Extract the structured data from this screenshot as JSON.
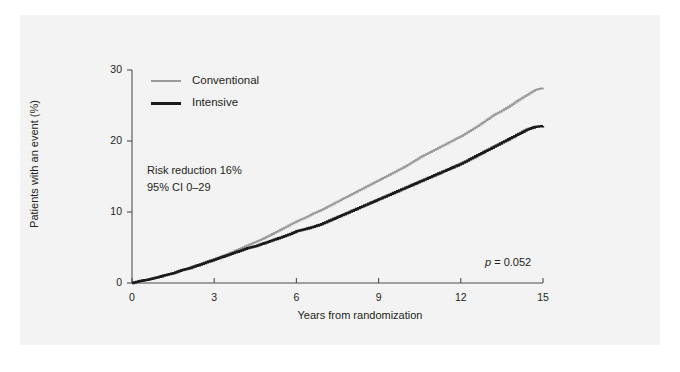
{
  "chart_data": {
    "type": "line",
    "title": "",
    "subtitle": "",
    "xlabel": "Years from randomization",
    "ylabel": "Patients with an event (%)",
    "xlim": [
      0,
      15
    ],
    "ylim": [
      0,
      30
    ],
    "xticks": [
      "0",
      "3",
      "6",
      "9",
      "12",
      "15"
    ],
    "xtick_values": [
      0,
      3,
      6,
      9,
      12,
      15
    ],
    "yticks": [
      "0",
      "10",
      "20",
      "30"
    ],
    "ytick_values": [
      0,
      10,
      20,
      30
    ],
    "grid": false,
    "legend_position": "top-left-inside",
    "step_style": "step-post",
    "series": [
      {
        "name": "Conventional",
        "color": "#9a9a9a",
        "x": [
          0,
          0.3,
          0.6,
          0.9,
          1.2,
          1.5,
          1.8,
          2.1,
          2.4,
          2.7,
          3.0,
          3.3,
          3.6,
          3.9,
          4.2,
          4.5,
          4.8,
          5.1,
          5.4,
          5.7,
          6.0,
          6.3,
          6.6,
          6.9,
          7.2,
          7.5,
          7.8,
          8.1,
          8.4,
          8.7,
          9.0,
          9.3,
          9.6,
          9.9,
          10.2,
          10.5,
          10.8,
          11.1,
          11.4,
          11.7,
          12.0,
          12.3,
          12.6,
          12.9,
          13.2,
          13.5,
          13.8,
          14.1,
          14.4,
          14.7,
          15.0
        ],
        "y": [
          0.0,
          0.3,
          0.5,
          0.8,
          1.1,
          1.4,
          1.8,
          2.2,
          2.6,
          3.0,
          3.4,
          3.8,
          4.3,
          4.8,
          5.3,
          5.8,
          6.3,
          6.9,
          7.5,
          8.1,
          8.7,
          9.2,
          9.8,
          10.3,
          10.9,
          11.5,
          12.1,
          12.7,
          13.3,
          13.9,
          14.5,
          15.1,
          15.7,
          16.3,
          17.0,
          17.7,
          18.3,
          18.9,
          19.5,
          20.1,
          20.7,
          21.4,
          22.1,
          22.9,
          23.7,
          24.3,
          25.0,
          25.8,
          26.5,
          27.2,
          27.5
        ]
      },
      {
        "name": "Intensive",
        "color": "#1a1a1a",
        "x": [
          0,
          0.3,
          0.6,
          0.9,
          1.2,
          1.5,
          1.8,
          2.1,
          2.4,
          2.7,
          3.0,
          3.3,
          3.6,
          3.9,
          4.2,
          4.5,
          4.8,
          5.1,
          5.4,
          5.7,
          6.0,
          6.3,
          6.6,
          6.9,
          7.2,
          7.5,
          7.8,
          8.1,
          8.4,
          8.7,
          9.0,
          9.3,
          9.6,
          9.9,
          10.2,
          10.5,
          10.8,
          11.1,
          11.4,
          11.7,
          12.0,
          12.3,
          12.6,
          12.9,
          13.2,
          13.5,
          13.8,
          14.1,
          14.4,
          14.7,
          15.0
        ],
        "y": [
          0.0,
          0.3,
          0.5,
          0.8,
          1.1,
          1.4,
          1.8,
          2.1,
          2.5,
          2.9,
          3.3,
          3.7,
          4.1,
          4.5,
          4.9,
          5.2,
          5.6,
          6.0,
          6.4,
          6.8,
          7.3,
          7.6,
          7.9,
          8.3,
          8.8,
          9.3,
          9.8,
          10.3,
          10.8,
          11.3,
          11.8,
          12.3,
          12.8,
          13.3,
          13.8,
          14.3,
          14.8,
          15.3,
          15.8,
          16.3,
          16.8,
          17.4,
          18.0,
          18.6,
          19.2,
          19.8,
          20.4,
          21.0,
          21.6,
          22.0,
          22.1
        ]
      }
    ],
    "annotations": [
      {
        "id": "risk-reduction",
        "text": "Risk reduction 16%"
      },
      {
        "id": "confidence-interval",
        "text": "95% CI 0–29"
      },
      {
        "id": "p-value",
        "text_prefix": "p",
        "text_suffix": " = 0.052"
      }
    ]
  },
  "legend": {
    "items": [
      {
        "label": "Conventional",
        "color": "#9a9a9a"
      },
      {
        "label": "Intensive",
        "color": "#1a1a1a"
      }
    ]
  }
}
